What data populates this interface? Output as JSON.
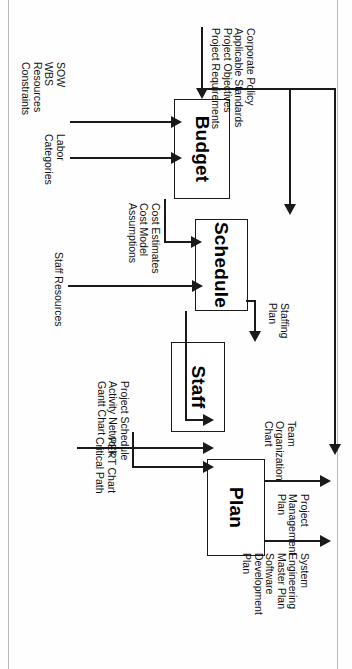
{
  "diagram": {
    "type": "flowchart",
    "orientation": "rotated-90-clockwise",
    "process_boxes": [
      {
        "id": "budget",
        "label": "Budget"
      },
      {
        "id": "schedule",
        "label": "Schedule"
      },
      {
        "id": "staff",
        "label": "Staff"
      },
      {
        "id": "plan",
        "label": "Plan"
      }
    ],
    "inputs": [
      {
        "id": "budget-top-input",
        "target": "budget",
        "lines": [
          "Corporate Policy",
          "Applicable Standards",
          "Project Objectives",
          "Project Requirements"
        ]
      },
      {
        "id": "budget-bottom-input",
        "target": "budget",
        "lines": [
          "SOW",
          "WBS",
          "Resources",
          "Constraints"
        ]
      },
      {
        "id": "labor-input",
        "target": "budget",
        "lines": [
          "Labor",
          "Categories"
        ]
      },
      {
        "id": "staff-resources-input",
        "target": "schedule",
        "lines": [
          "Staff Resources"
        ]
      }
    ],
    "flows": [
      {
        "id": "budget-to-schedule",
        "from": "budget",
        "to": "schedule",
        "lines": [
          "Cost Estimates",
          "Cost Model",
          "Assumptions"
        ]
      },
      {
        "id": "schedule-to-staff",
        "from": "schedule",
        "to": "staff",
        "lines": [
          "Staffing",
          "Plan"
        ]
      },
      {
        "id": "schedule-to-plan",
        "from": "schedule",
        "to": "plan",
        "lines": [
          "Project Schedule",
          "Activity Network",
          "Gantt Chart"
        ]
      },
      {
        "id": "pert-to-plan",
        "from": "schedule",
        "to": "plan",
        "lines": [
          "PERT Chart",
          "Critical Path"
        ]
      },
      {
        "id": "staff-to-plan",
        "from": "staff",
        "to": "plan",
        "lines": [
          "Team",
          "Organization",
          "Chart"
        ]
      }
    ],
    "outputs": [
      {
        "id": "pmp-output",
        "source": "plan",
        "lines": [
          "Project",
          "Management",
          "Plan"
        ]
      },
      {
        "id": "semp-output",
        "source": "plan",
        "lines": [
          "System",
          "Engineering",
          "Master Plan",
          "Software",
          "Development",
          "Plan"
        ]
      }
    ],
    "colors": {
      "stroke": "#1a1a1a",
      "text": "#111111",
      "background": "#fefefe",
      "page_rule": "#b9b9b9"
    }
  }
}
